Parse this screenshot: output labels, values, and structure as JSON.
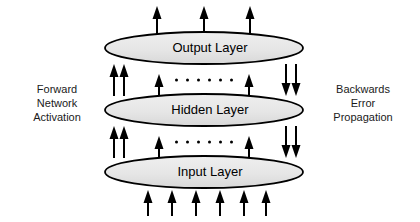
{
  "diagram": {
    "title_present": false,
    "background_color": "#ffffff",
    "ellipse_fill": "#e8e8e8",
    "ellipse_stroke": "#000000",
    "arrow_color": "#000000",
    "text_color": "#000000",
    "layers": [
      {
        "id": "output",
        "label": "Output Layer",
        "cx": 204,
        "cy": 48,
        "rx": 99,
        "ry": 16
      },
      {
        "id": "hidden",
        "label": "Hidden Layer",
        "cx": 204,
        "cy": 110,
        "rx": 99,
        "ry": 16
      },
      {
        "id": "input",
        "label": "Input Layer",
        "cx": 204,
        "cy": 172,
        "rx": 99,
        "ry": 16
      }
    ],
    "side_labels": {
      "left": {
        "text": "Forward\nNetwork\nActivation",
        "meaning": "forward-network-activation"
      },
      "right": {
        "text": "Backwards\nError\nPropagation",
        "meaning": "backwards-error-propagation"
      }
    },
    "ellipsis": {
      "dot_count": 6,
      "positions_y": [
        80,
        142
      ],
      "center_x": 204
    },
    "arrow_groups": [
      {
        "name": "output-arrows",
        "direction": "up",
        "count": 3,
        "x_positions": [
          157,
          204,
          250
        ],
        "y_top": 6,
        "y_bottom": 34
      },
      {
        "name": "hidden-to-output-left",
        "direction": "up",
        "count": 2,
        "x_positions": [
          114,
          124
        ],
        "y_top": 64,
        "y_bottom": 96
      },
      {
        "name": "hidden-to-output-center",
        "direction": "up",
        "count": 2,
        "x_positions": [
          159,
          249
        ],
        "y_top": 74,
        "y_bottom": 96
      },
      {
        "name": "output-to-hidden-right",
        "direction": "down",
        "count": 2,
        "x_positions": [
          286,
          296
        ],
        "y_top": 64,
        "y_bottom": 96
      },
      {
        "name": "input-to-hidden-left",
        "direction": "up",
        "count": 2,
        "x_positions": [
          114,
          124
        ],
        "y_top": 126,
        "y_bottom": 158
      },
      {
        "name": "input-to-hidden-center",
        "direction": "up",
        "count": 2,
        "x_positions": [
          159,
          249
        ],
        "y_top": 136,
        "y_bottom": 158
      },
      {
        "name": "hidden-to-input-right",
        "direction": "down",
        "count": 2,
        "x_positions": [
          286,
          296
        ],
        "y_top": 126,
        "y_bottom": 158
      },
      {
        "name": "input-arrows",
        "direction": "up",
        "count": 6,
        "x_positions": [
          148,
          172,
          196,
          220,
          244,
          266
        ],
        "y_top": 190,
        "y_bottom": 216
      }
    ]
  }
}
